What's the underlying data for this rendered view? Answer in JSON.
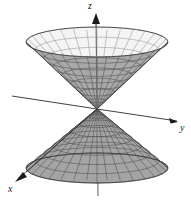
{
  "figure": {
    "background_color": "#ffffff",
    "width": 191,
    "height": 201
  },
  "axes": {
    "z": {
      "label": "z",
      "direction": "up",
      "arrow": true,
      "color": "#1a1a1a",
      "origin": [
        97,
        109
      ],
      "tip": [
        96,
        14
      ]
    },
    "y": {
      "label": "y",
      "direction": "right-down",
      "arrow": true,
      "color": "#1a1a1a",
      "origin": [
        97,
        109
      ],
      "tip": [
        178,
        122
      ]
    },
    "x": {
      "label": "x",
      "direction": "left-down",
      "arrow": true,
      "color": "#1a1a1a",
      "origin": [
        97,
        109
      ],
      "tip": [
        16,
        180
      ]
    }
  },
  "surface": {
    "name": "double-cone",
    "type": "elliptic-cone",
    "shading": "gray-mesh",
    "fill_front": "#a8a8a8",
    "fill_back": "#f2f2f2",
    "mesh_color": "#4a4a4a",
    "outline_color": "#3a3a3a",
    "radial_lines": 28,
    "ring_lines": 9,
    "upper_nappe": {
      "apex": [
        97,
        109
      ],
      "rim_center": [
        97,
        42
      ],
      "rim_rx": 71,
      "rim_ry": 15
    },
    "lower_nappe": {
      "apex": [
        97,
        109
      ],
      "rim_center": [
        97,
        168
      ],
      "rim_rx": 71,
      "rim_ry": 15
    }
  }
}
